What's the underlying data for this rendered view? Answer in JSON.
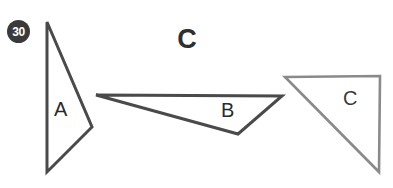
{
  "page": {
    "width": 393,
    "height": 188,
    "background": "#ffffff"
  },
  "badge": {
    "name": "problem-number-badge",
    "text": "30",
    "fill": "#3a3a3a",
    "text_color": "#ffffff",
    "cx": 18.5,
    "cy": 31.5,
    "r": 11.5
  },
  "title": {
    "text": "C",
    "color": "#2f2f2f",
    "x": 186,
    "y": 42
  },
  "figure": {
    "stroke_dark": "#4a4a4a",
    "stroke_light": "#8a8a8a",
    "fill": "none",
    "stroke_width_dark": 3,
    "stroke_width_light": 2.6,
    "shapes": [
      {
        "id": "triangle-a",
        "label": "A",
        "label_x": 60,
        "label_y": 113,
        "stroke": "#4a4a4a",
        "stroke_width": 3,
        "points": "47,22 92,127 47,172"
      },
      {
        "id": "triangle-b",
        "label": "B",
        "label_x": 227,
        "label_y": 115,
        "stroke": "#4a4a4a",
        "stroke_width": 3,
        "points": "96,95 282,96 238,134"
      },
      {
        "id": "triangle-c",
        "label": "C",
        "label_x": 349,
        "label_y": 103,
        "stroke": "#8a8a8a",
        "stroke_width": 2.6,
        "points": "285,77 380,76 379,172"
      }
    ]
  },
  "labels": {
    "a": "A",
    "b": "B",
    "c": "C"
  }
}
